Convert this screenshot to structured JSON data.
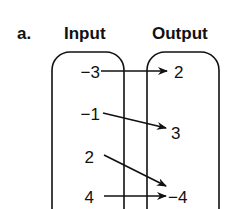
{
  "part_label": "a.",
  "input_header": "Input",
  "output_header": "Output",
  "inputs": [
    "−3",
    "−1",
    "2",
    "4"
  ],
  "outputs": [
    "2",
    "3",
    "−4"
  ],
  "mappings": [
    {
      "from": "−3",
      "to": "2"
    },
    {
      "from": "−1",
      "to": "3"
    },
    {
      "from": "2",
      "to": "−4"
    },
    {
      "from": "4",
      "to": "−4"
    }
  ],
  "colors": {
    "ink": "#111111",
    "background": "#ffffff"
  }
}
